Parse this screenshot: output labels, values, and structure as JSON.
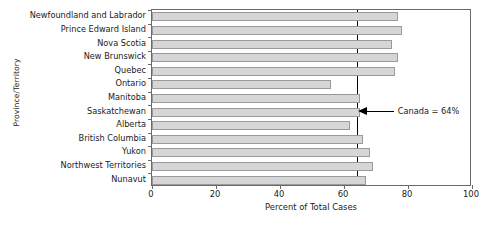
{
  "chart_data": {
    "type": "bar",
    "orientation": "horizontal",
    "title": "",
    "xlabel": "Percent of Total Cases",
    "ylabel": "Province/Territory",
    "xlim": [
      0,
      100
    ],
    "xticks": [
      0,
      20,
      40,
      60,
      80,
      100
    ],
    "xticklabels": [
      "0",
      "20",
      "40",
      "60",
      "80",
      "100"
    ],
    "grid": false,
    "legend": null,
    "categories": [
      "Newfoundland and Labrador",
      "Prince Edward Island",
      "Nova Scotia",
      "New Brunswick",
      "Quebec",
      "Ontario",
      "Manitoba",
      "Saskatchewan",
      "Alberta",
      "British Columbia",
      "Yukon",
      "Northwest Territories",
      "Nunavut"
    ],
    "values": [
      77,
      78,
      75,
      77,
      76,
      56,
      65,
      65,
      62,
      66,
      68,
      69,
      67
    ],
    "bar_color": "#d6d6d6",
    "bar_edge_color": "#9a9a9a",
    "annotations": [
      {
        "label": "Canada = 64%",
        "value": 64,
        "reference_line_color": "#000000"
      }
    ]
  }
}
